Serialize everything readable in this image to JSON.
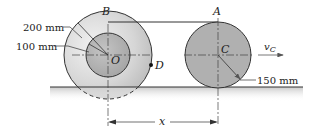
{
  "diagram": {
    "points": {
      "B": "B",
      "A": "A",
      "O": "O",
      "C": "C",
      "D": "D"
    },
    "dimensions": {
      "outer_radius_B": "200 mm",
      "inner_radius_B": "100 mm",
      "radius_A": "150 mm",
      "separation": "x"
    },
    "velocity": {
      "symbol": "v",
      "subscript": "C"
    },
    "colors": {
      "outer_wheel": "#d9d9d9",
      "inner_hub": "#b3b3b3",
      "wheel_A": "#b0b0b0",
      "ground_shade": "#cfcfcf",
      "line": "#333333"
    }
  }
}
